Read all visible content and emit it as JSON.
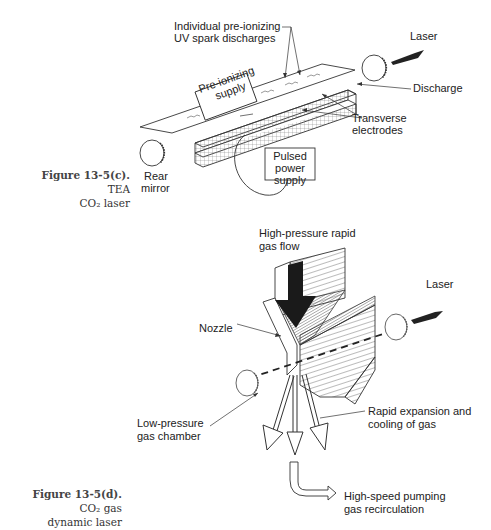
{
  "figure_c": {
    "caption_bold": "Figure 13-5(c).",
    "caption_rest_1": "TEA",
    "caption_rest_2": "CO₂ laser",
    "labels": {
      "preionizing_discharges_1": "Individual pre-ionizing",
      "preionizing_discharges_2": "UV spark discharges",
      "laser": "Laser",
      "discharge": "Discharge",
      "transverse_1": "Transverse",
      "transverse_2": "electrodes",
      "rear_mirror_1": "Rear",
      "rear_mirror_2": "mirror",
      "preionizing_supply_1": "Pre-ionizing",
      "preionizing_supply_2": "supply",
      "pulsed_1": "Pulsed",
      "pulsed_2": "power",
      "pulsed_3": "supply"
    }
  },
  "figure_d": {
    "caption_bold": "Figure 13-5(d).",
    "caption_rest_1": "CO₂ gas",
    "caption_rest_2": "dynamic laser",
    "labels": {
      "gas_flow_1": "High-pressure rapid",
      "gas_flow_2": "gas flow",
      "laser": "Laser",
      "nozzle": "Nozzle",
      "low_pressure_1": "Low-pressure",
      "low_pressure_2": "gas chamber",
      "expansion_1": "Rapid expansion and",
      "expansion_2": "cooling of gas",
      "pumping_1": "High-speed pumping",
      "pumping_2": "gas recirculation"
    }
  }
}
